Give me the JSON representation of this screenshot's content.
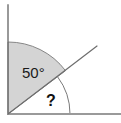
{
  "figure": {
    "canvas": {
      "width": 121,
      "height": 123,
      "background": "#ffffff"
    },
    "colors": {
      "sector_fill": "#d4d4d4",
      "sector_stroke": "#7a7a7a",
      "ray_stroke": "#6e6e6e",
      "arc_stroke": "#7a7a7a",
      "text": "#1a1a1a",
      "frame": "#b8b8b8"
    },
    "vertex": {
      "x": 8,
      "y": 114
    },
    "rays": [
      {
        "name": "vertical-ray",
        "from": [
          8,
          114
        ],
        "to": [
          8,
          5
        ]
      },
      {
        "name": "horizontal-ray",
        "from": [
          8,
          114
        ],
        "to": [
          121,
          114
        ]
      },
      {
        "name": "diagonal-ray",
        "from": [
          8,
          114
        ],
        "to": [
          97,
          46
        ]
      }
    ],
    "sector": {
      "name": "shaded-sector",
      "radius": 72,
      "start_angle_deg": 90,
      "end_angle_deg": 37,
      "fill": "#d4d4d4"
    },
    "unknown_arc": {
      "name": "question-arc",
      "radius": 62,
      "start_angle_deg": 37,
      "end_angle_deg": 0
    },
    "labels": {
      "known_angle": "50°",
      "known_angle_pos": {
        "x": 22,
        "y": 78
      },
      "unknown_angle": "?",
      "unknown_angle_pos": {
        "x": 46,
        "y": 106
      }
    }
  }
}
